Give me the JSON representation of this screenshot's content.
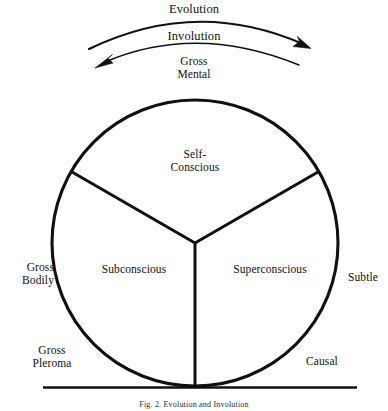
{
  "figure": {
    "caption": "Fig. 2. Evolution and Involution",
    "arcs": {
      "evolution": "Evolution",
      "involution": "Involution"
    },
    "top_label": "Gross\nMental",
    "sectors": [
      {
        "id": "self-conscious",
        "label": "Self-\nConscious"
      },
      {
        "id": "subconscious",
        "label": "Subconscious"
      },
      {
        "id": "superconscious",
        "label": "Superconscious"
      }
    ],
    "outer_labels": [
      {
        "id": "gross-bodily",
        "label": "Gross\nBodily"
      },
      {
        "id": "subtle",
        "label": "Subtle"
      },
      {
        "id": "gross-pleroma",
        "label": "Gross\nPleroma"
      },
      {
        "id": "causal",
        "label": "Causal"
      }
    ],
    "geometry": {
      "center_x": 195,
      "center_y": 243,
      "radius": 143,
      "divider_angles_deg": [
        90,
        210,
        330
      ],
      "baseline_y": 387
    },
    "colors": {
      "ink": "#111111",
      "background": "#ffffff"
    }
  }
}
